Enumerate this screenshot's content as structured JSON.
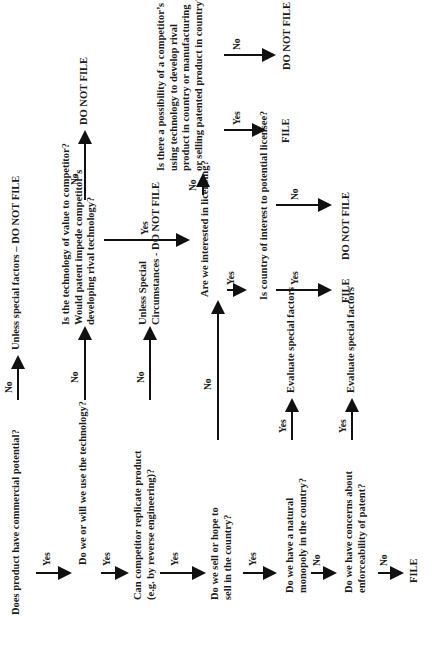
{
  "flowchart": {
    "q1": "Does product have commercial potential?",
    "q1_no_result": "Unless special factors – DO NOT FILE",
    "q2": "Do we or will we use the technology?",
    "q2b_lines": [
      "Is the technology of value to competitor?",
      "Would patent impede competitor’s",
      "developing rival technology?"
    ],
    "q2b_no_result": "DO NOT FILE",
    "q3_lines": [
      "Can competitor replicate product",
      "(e.g. by reverse engineering)?"
    ],
    "q3_no_result_lines": [
      "Unless Special",
      "Circumstances - DO NOT FILE"
    ],
    "q4_lines": [
      "Do we sell or hope to",
      "sell in the country?"
    ],
    "q4b": "Are we interested in licensing?",
    "q4c_lines": [
      "Is there a possibility of a competitor’s",
      "using technology to develop rival",
      "product in country or manufacturing",
      "or selling patented product in country?"
    ],
    "q4c_yes_result": "FILE",
    "q4c_no_result": "DO NOT FILE",
    "q4d": "Is country of interest to potential licensee?",
    "q4d_yes_result": "FILE",
    "q4d_no_result": "DO NOT FILE",
    "q5_lines": [
      "Do we have a natural",
      "monopoly in the country?"
    ],
    "q5_yes_result": "Evaluate special factors",
    "q6_lines": [
      "Do we have concerns about",
      "enforceability of patent?"
    ],
    "q6_yes_result": "Evaluate special factors",
    "q6_no_result": "FILE"
  },
  "labels": {
    "yes": "Yes",
    "no": "No"
  }
}
